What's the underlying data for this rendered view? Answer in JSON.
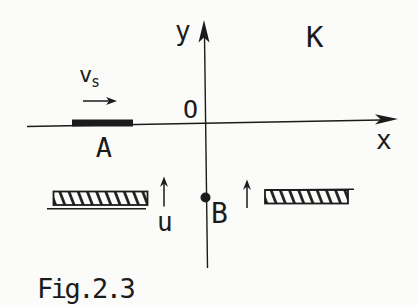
{
  "figure": {
    "caption": "Fig.2.3",
    "frame_label": "K",
    "axis_x_label": "x",
    "axis_y_label": "y",
    "origin_label": "O",
    "rod_label": "A",
    "velocity_label": "v",
    "velocity_subscript": "s",
    "point_label": "B",
    "flow_label": "u"
  },
  "colors": {
    "ink": "#1b1b1b",
    "paper": "#fbfbf9"
  }
}
